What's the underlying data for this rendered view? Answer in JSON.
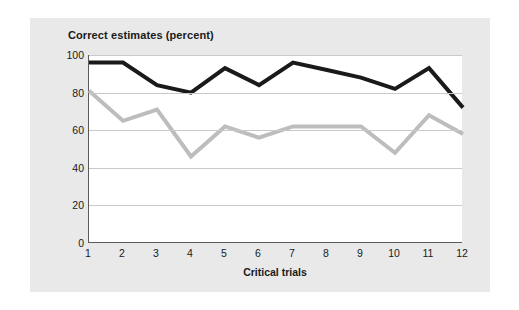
{
  "chart_data": {
    "type": "line",
    "title": "Correct estimates (percent)",
    "xlabel": "Critical trials",
    "ylabel": "",
    "categories": [
      "1",
      "2",
      "3",
      "4",
      "5",
      "6",
      "7",
      "8",
      "9",
      "10",
      "11",
      "12"
    ],
    "x": [
      1,
      2,
      3,
      4,
      5,
      6,
      7,
      8,
      9,
      10,
      11,
      12
    ],
    "ylim": [
      0,
      100
    ],
    "xlim": [
      1,
      12
    ],
    "yticks": [
      0,
      20,
      40,
      60,
      80,
      100
    ],
    "ytick_labels": [
      "0",
      "20",
      "40",
      "60",
      "80",
      "100"
    ],
    "xticks": [
      1,
      2,
      3,
      4,
      5,
      6,
      7,
      8,
      9,
      10,
      11,
      12
    ],
    "xtick_labels": [
      "1",
      "2",
      "3",
      "4",
      "5",
      "6",
      "7",
      "8",
      "9",
      "10",
      "11",
      "12"
    ],
    "grid": "horizontal",
    "legend": "none",
    "series": [
      {
        "name": "black-series",
        "color": "#1a1a1a",
        "line_width": 4,
        "values": [
          96,
          96,
          84,
          80,
          93,
          84,
          96,
          92,
          88,
          82,
          93,
          72
        ]
      },
      {
        "name": "gray-series",
        "color": "#bdbdbd",
        "line_width": 4,
        "values": [
          81,
          65,
          71,
          46,
          62,
          56,
          62,
          62,
          62,
          48,
          68,
          58
        ]
      }
    ],
    "colors": {
      "panel_background": "#e9e9e9",
      "plot_background": "#ffffff",
      "axis": "#5a5a5a",
      "gridline": "#c9c9c9",
      "text": "#1a1a1a"
    }
  }
}
